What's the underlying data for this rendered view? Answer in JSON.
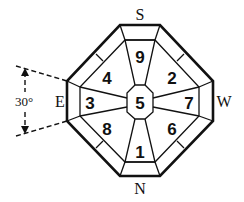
{
  "diagram": {
    "directions": {
      "top": "S",
      "bottom": "N",
      "left": "E",
      "right": "W"
    },
    "center_number": "5",
    "sectors": [
      {
        "position": "top",
        "number": "9"
      },
      {
        "position": "top-right",
        "number": "2"
      },
      {
        "position": "right",
        "number": "7"
      },
      {
        "position": "bottom-right",
        "number": "6"
      },
      {
        "position": "bottom",
        "number": "1"
      },
      {
        "position": "bottom-left",
        "number": "8"
      },
      {
        "position": "left",
        "number": "3"
      },
      {
        "position": "top-left",
        "number": "4"
      }
    ],
    "angle_annotation": "30°",
    "colors": {
      "stroke": "#111111",
      "background": "#ffffff"
    }
  }
}
